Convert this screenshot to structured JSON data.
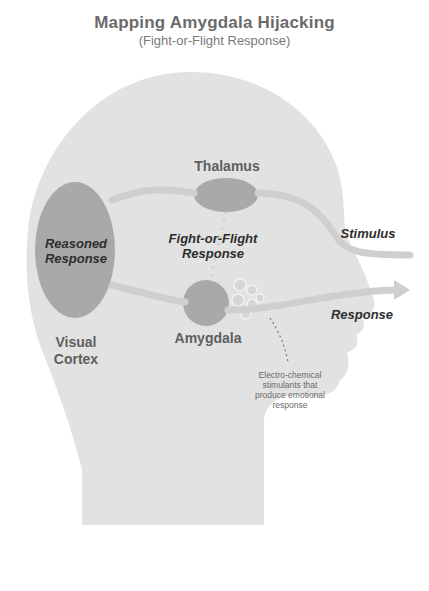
{
  "title": "Mapping Amygdala Hijacking",
  "subtitle": "(Fight-or-Flight Response)",
  "regions": {
    "thalamus": "Thalamus",
    "amygdala": "Amygdala",
    "visual_cortex_line1": "Visual",
    "visual_cortex_line2": "Cortex"
  },
  "pathways": {
    "reasoned_line1": "Reasoned",
    "reasoned_line2": "Response",
    "fight_line1": "Fight-or-Flight",
    "fight_line2": "Response",
    "stimulus": "Stimulus",
    "response": "Response"
  },
  "annotation": {
    "line1": "Electro-chemical",
    "line2": "stimulants that",
    "line3": "produce emotional",
    "line4": "response"
  },
  "colors": {
    "head": "#e2e2e2",
    "organ": "#a9a9a9",
    "pathway": "#cfcfcf",
    "background": "#ffffff"
  }
}
